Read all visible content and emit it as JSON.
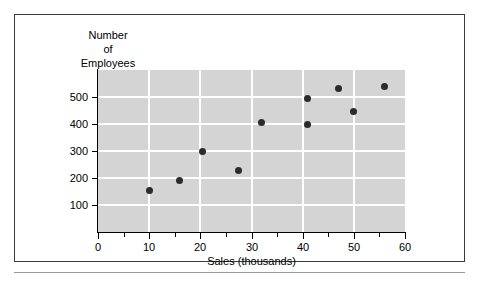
{
  "chart_data": {
    "type": "scatter",
    "title": "",
    "xlabel": "Sales (thousands)",
    "ylabel": "Number of Employees",
    "ylabel_lines": [
      "Number",
      "of",
      "Employees"
    ],
    "xlim": [
      0,
      60
    ],
    "ylim": [
      0,
      600
    ],
    "x_ticks": [
      0,
      10,
      20,
      30,
      40,
      50,
      60
    ],
    "x_tick_labels": [
      "0",
      "10",
      "20",
      "30",
      "40",
      "50",
      "60"
    ],
    "x_minor_ticks": [
      5,
      15,
      25,
      35,
      45,
      55
    ],
    "y_ticks": [
      100,
      200,
      300,
      400,
      500
    ],
    "y_tick_labels": [
      "100",
      "200",
      "300",
      "400",
      "500"
    ],
    "y_origin_label": "0",
    "grid": true,
    "grid_color": "#ffffff",
    "plot_background": "#d4d4d4",
    "marker_color": "#2b2b2b",
    "legend": null,
    "points": [
      {
        "x": 10,
        "y": 155
      },
      {
        "x": 16,
        "y": 192
      },
      {
        "x": 20.5,
        "y": 300
      },
      {
        "x": 27.5,
        "y": 228
      },
      {
        "x": 32,
        "y": 405
      },
      {
        "x": 41,
        "y": 398
      },
      {
        "x": 41,
        "y": 495
      },
      {
        "x": 47,
        "y": 533
      },
      {
        "x": 50,
        "y": 445
      },
      {
        "x": 56,
        "y": 540
      }
    ]
  }
}
